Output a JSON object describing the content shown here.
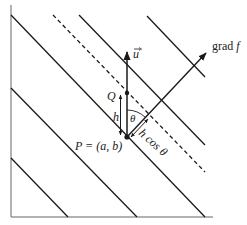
{
  "figure": {
    "type": "contour diagram with directional derivative geometry",
    "colors": {
      "line": "#1a1a1a",
      "axis": "#555555",
      "background": "#ffffff"
    },
    "labels": {
      "gradient": "grad f",
      "gradient_word": "grad",
      "gradient_var": "f",
      "unit_vector": "u",
      "point_q": "Q",
      "point_p": "P = (a, b)",
      "step": "h",
      "angle": "θ",
      "projection": "h cos θ"
    },
    "contours": {
      "solid_count": 5,
      "dashed_count": 1
    }
  }
}
